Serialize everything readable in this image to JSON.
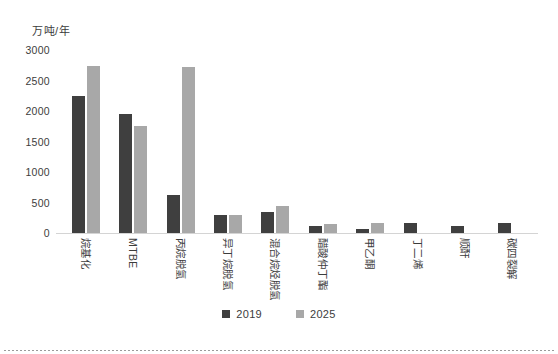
{
  "chart_data": {
    "type": "bar",
    "title": "",
    "subtitle": "",
    "xlabel": "",
    "ylabel": "万吨/年",
    "ylim": [
      0,
      3000
    ],
    "yticks": [
      0,
      500,
      1000,
      1500,
      2000,
      2500,
      3000
    ],
    "ytick_labels": [
      "0",
      "500",
      "1000",
      "1500",
      "2000",
      "2500",
      "3000"
    ],
    "grid": false,
    "legend_position": "bottom-center",
    "categories": [
      "烷基化",
      "MTBE",
      "丙烷脱氢",
      "异丁烷脱氢",
      "混合烷烃脱氢",
      "醋酸仲丁酯",
      "甲乙酮",
      "丁二烯",
      "顺酐",
      "碳四裂解"
    ],
    "series": [
      {
        "name": "2019",
        "color": "#3f3f3f",
        "values": [
          2250,
          1950,
          620,
          290,
          340,
          120,
          70,
          170,
          120,
          160
        ]
      },
      {
        "name": "2025",
        "color": "#a8a8a8",
        "values": [
          2740,
          1760,
          2720,
          290,
          450,
          140,
          170,
          null,
          null,
          null
        ]
      }
    ]
  },
  "legend": {
    "items": [
      {
        "label": "2019",
        "color": "#3f3f3f"
      },
      {
        "label": "2025",
        "color": "#a8a8a8"
      }
    ]
  }
}
